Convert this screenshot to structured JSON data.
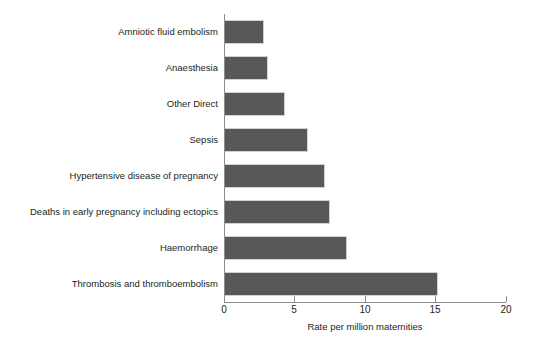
{
  "chart_data": {
    "type": "bar",
    "orientation": "horizontal",
    "title": "",
    "xlabel": "Rate per million maternities",
    "ylabel": "",
    "xlim": [
      0,
      20
    ],
    "xticks": [
      0,
      5,
      10,
      15,
      20
    ],
    "xtick_labels": [
      "0",
      "5",
      "10",
      "15",
      "20"
    ],
    "grid": false,
    "legend": null,
    "bar_color": "#585858",
    "bar_edge_color": "#d2d2d2",
    "axis_color": "#8d8d8d",
    "text_color": "#231f20",
    "categories": [
      "Amniotic fluid embolism",
      "Anaesthesia",
      "Other Direct",
      "Sepsis",
      "Hypertensive disease of pregnancy",
      "Deaths in early pregnancy including ectopics",
      "Haemorrhage",
      "Thrombosis and thromboembolism"
    ],
    "values": [
      2.7,
      3.0,
      4.2,
      5.8,
      7.0,
      7.4,
      8.6,
      15.0
    ]
  }
}
